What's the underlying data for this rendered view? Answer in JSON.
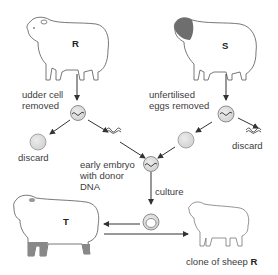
{
  "diagram": {
    "type": "flowchart",
    "sheep": {
      "R": {
        "label": "R"
      },
      "S": {
        "label": "S"
      },
      "T": {
        "label": "T"
      }
    },
    "labels": {
      "udder_cell": [
        "udder cell",
        "removed"
      ],
      "unfertilised_eggs": [
        "unfertilised",
        "eggs removed"
      ],
      "discard_left": "discard",
      "discard_right": "discard",
      "early_embryo": [
        "early embryo",
        "with donor",
        "DNA"
      ],
      "culture": "culture",
      "clone_prefix": "clone of sheep ",
      "clone_bold": "R"
    },
    "colors": {
      "cell_fill": "#dcdcdc",
      "line": "#333333",
      "dark_wool": "#6e6e6e"
    }
  }
}
